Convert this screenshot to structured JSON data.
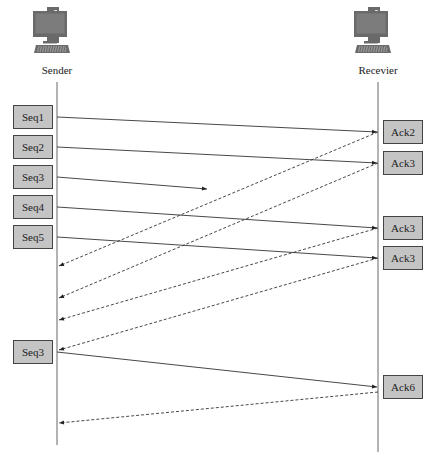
{
  "diagram": {
    "type": "sequence",
    "participants": [
      {
        "id": "sender",
        "label": "Sender",
        "icon": "computer-icon",
        "x": 57
      },
      {
        "id": "receiver",
        "label": "Recevier",
        "icon": "computer-icon",
        "x": 378
      }
    ],
    "sender_packets": [
      {
        "label": "Seq1",
        "y": 105
      },
      {
        "label": "Seq2",
        "y": 135
      },
      {
        "label": "Seq3",
        "y": 165
      },
      {
        "label": "Seq4",
        "y": 195
      },
      {
        "label": "Seq5",
        "y": 225
      },
      {
        "label": "Seq3",
        "y": 340
      }
    ],
    "receiver_packets": [
      {
        "label": "Ack2",
        "y": 120
      },
      {
        "label": "Ack3",
        "y": 151
      },
      {
        "label": "Ack3",
        "y": 216
      },
      {
        "label": "Ack3",
        "y": 246
      },
      {
        "label": "Ack6",
        "y": 375
      }
    ],
    "messages": [
      {
        "from": "Seq1",
        "to": "receiver",
        "style": "solid",
        "x1": 57,
        "y1": 117,
        "x2": 377,
        "y2": 132
      },
      {
        "from": "Seq2",
        "to": "receiver",
        "style": "solid",
        "x1": 57,
        "y1": 147,
        "x2": 377,
        "y2": 163
      },
      {
        "from": "Seq3",
        "to": "lost",
        "style": "solid",
        "x1": 57,
        "y1": 177,
        "x2": 207,
        "y2": 189
      },
      {
        "from": "Seq4",
        "to": "receiver",
        "style": "solid",
        "x1": 57,
        "y1": 207,
        "x2": 377,
        "y2": 228
      },
      {
        "from": "Seq5",
        "to": "receiver",
        "style": "solid",
        "x1": 57,
        "y1": 237,
        "x2": 377,
        "y2": 258
      },
      {
        "from": "Ack2",
        "to": "sender",
        "style": "dashed",
        "x1": 378,
        "y1": 132,
        "x2": 59,
        "y2": 266
      },
      {
        "from": "Ack3",
        "to": "sender",
        "style": "dashed",
        "x1": 378,
        "y1": 163,
        "x2": 59,
        "y2": 298
      },
      {
        "from": "Ack3",
        "to": "sender",
        "style": "dashed",
        "x1": 378,
        "y1": 228,
        "x2": 59,
        "y2": 320
      },
      {
        "from": "Ack3",
        "to": "sender",
        "style": "dashed",
        "x1": 378,
        "y1": 258,
        "x2": 59,
        "y2": 350
      },
      {
        "from": "Seq3",
        "to": "receiver",
        "style": "solid",
        "x1": 57,
        "y1": 352,
        "x2": 377,
        "y2": 387
      },
      {
        "from": "Ack6",
        "to": "sender",
        "style": "dashed",
        "x1": 378,
        "y1": 392,
        "x2": 59,
        "y2": 423
      }
    ],
    "colors": {
      "box_fill": "#c4c4c4",
      "box_border": "#444444",
      "line": "#333333",
      "lifeline": "#555555",
      "monitor": "#666666"
    }
  }
}
